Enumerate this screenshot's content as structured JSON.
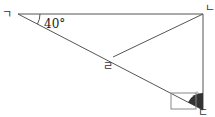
{
  "diagram": {
    "type": "geometry-triangle",
    "points": {
      "A": {
        "label": "ㄱ",
        "x": 18,
        "y": 14
      },
      "B": {
        "label": "ㄴ",
        "x": 203,
        "y": 14
      },
      "C": {
        "label": "ㄷ",
        "x": 203,
        "y": 110
      },
      "D": {
        "label": "ㄹ",
        "x": 113,
        "y": 57
      }
    },
    "segments": [
      "AB",
      "BC",
      "AC",
      "BD"
    ],
    "angle_label": "40°",
    "angle_at": "A",
    "marked_angle_at": "C",
    "right_angle_marker": "square",
    "colors": {
      "line": "#555555",
      "fill_angle": "#333333",
      "square": "#888888"
    }
  }
}
